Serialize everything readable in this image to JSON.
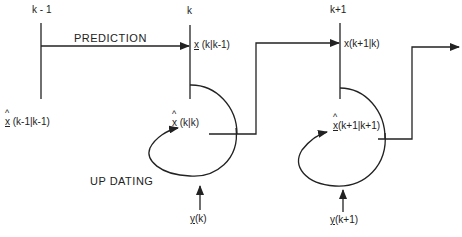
{
  "diagram": {
    "time_labels": {
      "k_minus_1": "k - 1",
      "k": "k",
      "k_plus_1": "k+1"
    },
    "process_labels": {
      "prediction": "PREDICTION",
      "updating": "UP DATING"
    },
    "states": {
      "prior_estimate_var": "x",
      "prior_estimate_args": "(k-1|k-1)",
      "prediction_k_var": "x",
      "prediction_k_args": "(k|k-1)",
      "update_k_var": "x",
      "update_k_args": "(k|k)",
      "prediction_k1_var": "x",
      "prediction_k1_args": "(k+1|k)",
      "update_k1_var": "x",
      "update_k1_args": "(k+1|k+1)"
    },
    "measurements": {
      "y_k_var": "y",
      "y_k_args": "(k)",
      "y_k1_var": "y",
      "y_k1_args": "(k+1)"
    },
    "line_color": "#222222"
  }
}
